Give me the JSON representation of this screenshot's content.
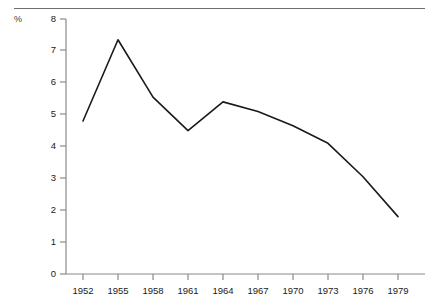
{
  "chart_data": {
    "type": "line",
    "title": "",
    "subtitle": "",
    "xlabel": "",
    "ylabel": "%",
    "unit_label": "%",
    "x": [
      1952,
      1955,
      1958,
      1961,
      1964,
      1967,
      1970,
      1973,
      1976,
      1979
    ],
    "values": [
      4.8,
      7.35,
      5.55,
      4.5,
      5.4,
      5.1,
      4.65,
      4.1,
      3.05,
      1.8
    ],
    "xtick_labels": [
      "1952",
      "1955",
      "1958",
      "1961",
      "1964",
      "1967",
      "1970",
      "1973",
      "1976",
      "1979"
    ],
    "ytick_labels": [
      "0",
      "1",
      "2",
      "3",
      "4",
      "5",
      "6",
      "7",
      "8"
    ],
    "yticks": [
      0,
      1,
      2,
      3,
      4,
      5,
      6,
      7,
      8
    ],
    "xlim": [
      1952,
      1979
    ],
    "ylim": [
      0,
      8
    ],
    "grid": false,
    "legend": false,
    "legend_position": "none",
    "series": [
      {
        "name": "",
        "values": [
          4.8,
          7.35,
          5.55,
          4.5,
          5.4,
          5.1,
          4.65,
          4.1,
          3.05,
          1.8
        ]
      }
    ],
    "line_color": "#1a1a1a",
    "axis_color": "#8a8a8a",
    "background_color": "#ffffff"
  }
}
